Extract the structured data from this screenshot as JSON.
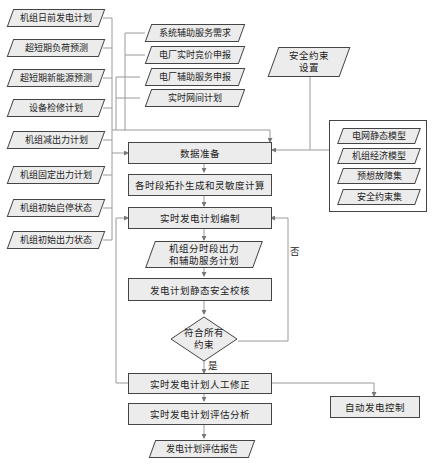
{
  "left_inputs": [
    {
      "label": "机组日前发电计划"
    },
    {
      "label": "超短期负荷预测"
    },
    {
      "label": "超短期新能源预测"
    },
    {
      "label": "设备检修计划"
    },
    {
      "label": "机组减出力计划"
    },
    {
      "label": "机组固定出力计划"
    },
    {
      "label": "机组初始启停状态"
    },
    {
      "label": "机组初始出力状态"
    }
  ],
  "top_inputs": [
    {
      "label": "系统辅助服务需求"
    },
    {
      "label": "电厂实时竞价申报"
    },
    {
      "label": "电厂辅助服务申报"
    },
    {
      "label": "实时网间计划"
    }
  ],
  "security_setting": {
    "line1": "安全约束",
    "line2": "设置"
  },
  "model_group": [
    {
      "label": "电网静态模型"
    },
    {
      "label": "机组经济模型"
    },
    {
      "label": "预想故障集"
    },
    {
      "label": "安全约束集"
    }
  ],
  "process": {
    "data_prep": "数据准备",
    "topology": "各时段拓扑生成和灵敏度计算",
    "compile": "实时发电计划编制",
    "output_line1": "机组分时段出力",
    "output_line2": "和辅助服务计划",
    "static_check": "发电计划静态安全校核",
    "decision_line1": "符合所有",
    "decision_line2": "约束",
    "manual_fix": "实时发电计划人工修正",
    "evaluation": "实时发电计划评估分析",
    "report": "发电计划评估报告",
    "agc": "自动发电控制"
  },
  "labels": {
    "no": "否",
    "yes": "是"
  },
  "colors": {
    "fill": "#ececec",
    "border": "#444444",
    "line": "#999999"
  }
}
